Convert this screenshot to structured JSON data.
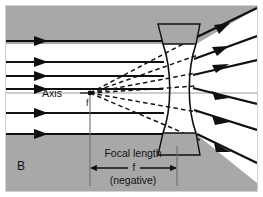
{
  "figure": {
    "panel_label": "B",
    "title_absent": true,
    "labels": {
      "axis": "Axis",
      "focal_point": "f",
      "focal_length": "Focal length",
      "focal_length_symbol": "f",
      "negative": "(negative)"
    },
    "colors": {
      "shaded_band": "#a8a8a8",
      "background": "#ffffff",
      "ray_stroke": "#101010",
      "dashed_stroke": "#151515",
      "axis_stroke": "#808080",
      "border": "#cfcfcf",
      "text": "#111111"
    },
    "optics": {
      "lens_type": "biconcave-diverging",
      "focal_length_sign": "negative",
      "focal_point_x": 90,
      "focal_point_y": 93,
      "lens_center_x": 177,
      "axis_y": 93,
      "incoming_ray_count": 6,
      "outgoing_ray_count": 6,
      "dashed_virtual_ray_count": 6,
      "incoming_ray_y": [
        41,
        62,
        76,
        89,
        113,
        134
      ],
      "outgoing_ray_end_y": [
        18,
        43,
        65,
        108,
        133,
        158
      ],
      "dimension_from_x": 90,
      "dimension_to_x": 177,
      "dimension_y": 168
    }
  }
}
